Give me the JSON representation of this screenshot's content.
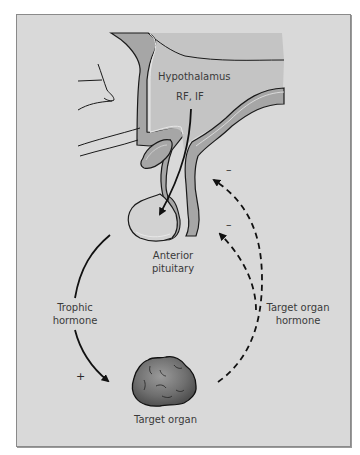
{
  "figure": {
    "type": "endocrine feedback loop",
    "colors": {
      "background": "#d9d9d9",
      "frame_border": "#8a8a8a",
      "tissue_dark": "#a6a6a6",
      "tissue_light": "#c4c4c4",
      "pituitary_light": "#d2d2d2",
      "outline": "#1a1a1a",
      "organ_fill": "#6e6e6e",
      "label_text": "#3a3a3a"
    }
  },
  "labels": {
    "hypothalamus": "Hypothalamus",
    "releasing_factors": "RF, IF",
    "anterior_pituitary_line1": "Anterior",
    "anterior_pituitary_line2": "pituitary",
    "trophic_hormone_line1": "Trophic",
    "trophic_hormone_line2": "hormone",
    "target_organ_hormone_line1": "Target organ",
    "target_organ_hormone_line2": "hormone",
    "target_organ": "Target organ"
  },
  "signs": {
    "positive": "+",
    "negative_to_hypothalamus": "–",
    "negative_to_pituitary": "–"
  },
  "arrows": [
    {
      "from": "Hypothalamus",
      "to": "Anterior pituitary",
      "style": "solid",
      "label": "RF, IF"
    },
    {
      "from": "Anterior pituitary",
      "to": "Target organ",
      "style": "solid",
      "label": "Trophic hormone",
      "sign": "+"
    },
    {
      "from": "Target organ",
      "to": "Hypothalamus",
      "style": "dashed",
      "label": "Target organ hormone",
      "sign": "–"
    },
    {
      "from": "Target organ",
      "to": "Anterior pituitary",
      "style": "dashed",
      "label": "Target organ hormone",
      "sign": "–"
    }
  ]
}
